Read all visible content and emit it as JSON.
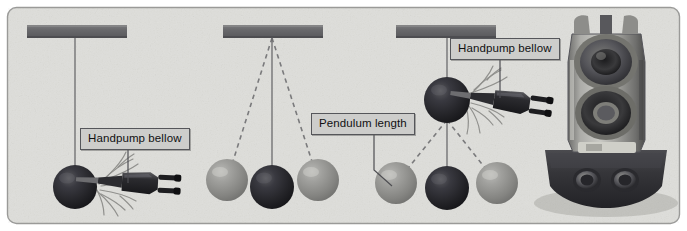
{
  "figure": {
    "type": "pendulum-apparatus-diagram",
    "background_color": "#dededa",
    "border_color": "#9a9a98",
    "support_bar_color": "#6e6e70",
    "dark_ball_color": "#2c2c2e",
    "light_ball_color": "#8e8e8c",
    "string_color": "#6b6b6d",
    "dashed_color": "#7a7a7c"
  },
  "callouts": [
    {
      "id": "handpump-bellow-left",
      "label": "Handpump bellow",
      "x": 80,
      "y": 128,
      "leader_to_x": 160,
      "leader_to_y": 182
    },
    {
      "id": "pendulum-length",
      "label": "Pendulum length",
      "x": 311,
      "y": 113,
      "leader_to_x": 382,
      "leader_to_y": 185
    },
    {
      "id": "handpump-bellow-right",
      "label": "Handpump bellow",
      "x": 450,
      "y": 38,
      "leader_to_x": 497,
      "leader_to_y": 98
    }
  ],
  "supports": [
    {
      "id": "support-bar-1",
      "x": 27,
      "y": 25,
      "width": 100,
      "height": 13
    },
    {
      "id": "support-bar-2",
      "x": 223,
      "y": 25,
      "width": 100,
      "height": 13
    },
    {
      "id": "support-bar-3",
      "x": 396,
      "y": 25,
      "width": 100,
      "height": 13
    }
  ],
  "pendulum_groups": [
    {
      "id": "group-1",
      "pivot": {
        "x": 75,
        "y": 38
      },
      "balls": [
        {
          "id": "g1-ball-rest",
          "x": 75,
          "y": 187,
          "r": 22,
          "shade": "dark",
          "has_air_burst": true
        }
      ],
      "strings": [
        {
          "x1": 75,
          "y1": 38,
          "x2": 75,
          "y2": 187,
          "style": "solid"
        }
      ],
      "nozzle": {
        "x": 128,
        "y": 182,
        "angle": 4
      }
    },
    {
      "id": "group-2",
      "pivot": {
        "x": 272,
        "y": 38
      },
      "balls": [
        {
          "id": "g2-ball-left",
          "x": 227,
          "y": 180,
          "r": 21,
          "shade": "light",
          "has_air_burst": false
        },
        {
          "id": "g2-ball-rest",
          "x": 272,
          "y": 187,
          "r": 22,
          "shade": "dark",
          "has_air_burst": false
        },
        {
          "id": "g2-ball-right",
          "x": 318,
          "y": 180,
          "r": 21,
          "shade": "light",
          "has_air_burst": false
        }
      ],
      "strings": [
        {
          "x1": 272,
          "y1": 38,
          "x2": 227,
          "y2": 180,
          "style": "dashed"
        },
        {
          "x1": 272,
          "y1": 38,
          "x2": 272,
          "y2": 187,
          "style": "solid"
        },
        {
          "x1": 272,
          "y1": 38,
          "x2": 318,
          "y2": 180,
          "style": "dashed"
        }
      ],
      "nozzle": null
    },
    {
      "id": "group-3",
      "pivot": {
        "x": 447,
        "y": 38
      },
      "balls": [
        {
          "id": "g3-ball-raised",
          "x": 447,
          "y": 100,
          "r": 23,
          "shade": "dark",
          "has_air_burst": true
        },
        {
          "id": "g3-ball-left",
          "x": 396,
          "y": 183,
          "r": 21,
          "shade": "light",
          "has_air_burst": false
        },
        {
          "id": "g3-ball-rest",
          "x": 447,
          "y": 188,
          "r": 22,
          "shade": "dark",
          "has_air_burst": false
        },
        {
          "id": "g3-ball-right",
          "x": 497,
          "y": 183,
          "r": 21,
          "shade": "light",
          "has_air_burst": false
        }
      ],
      "strings": [
        {
          "x1": 447,
          "y1": 38,
          "x2": 447,
          "y2": 188,
          "style": "solid"
        },
        {
          "x1": 447,
          "y1": 120,
          "x2": 396,
          "y2": 183,
          "style": "dashed"
        },
        {
          "x1": 447,
          "y1": 120,
          "x2": 497,
          "y2": 183,
          "style": "dashed"
        }
      ],
      "nozzle": {
        "x": 497,
        "y": 98,
        "angle": 10
      }
    }
  ],
  "device": {
    "id": "handpump-bellow-device",
    "name": "handpump bellow body",
    "x": 548,
    "y": 20,
    "width": 120,
    "height": 195,
    "barrel_color": "#9d9d9b",
    "base_color": "#36363a"
  }
}
